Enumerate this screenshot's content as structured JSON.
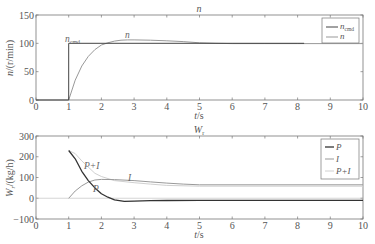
{
  "chart_data": [
    {
      "type": "line",
      "title": "n",
      "xlabel": "t/s",
      "ylabel": "n/(r/min)",
      "xlim": [
        0,
        10
      ],
      "ylim": [
        0,
        150
      ],
      "xticks": [
        "0",
        "1",
        "2",
        "3",
        "4",
        "5",
        "6",
        "7",
        "8",
        "9",
        "10"
      ],
      "yticks": [
        "0",
        "50",
        "100",
        "150"
      ],
      "grid": false,
      "legend_position": "upper right",
      "legend": [
        "n_cmd",
        "n"
      ],
      "annotations": [
        {
          "text": "n_cmd",
          "x": 0.9,
          "y": 103
        },
        {
          "text": "n",
          "x": 2.8,
          "y": 110
        }
      ],
      "series": [
        {
          "name": "n_cmd",
          "color": "#444444",
          "x": [
            0,
            1,
            1,
            8.2
          ],
          "y": [
            0,
            0,
            100,
            100
          ]
        },
        {
          "name": "n",
          "color": "#999999",
          "x": [
            1,
            1.2,
            1.4,
            1.6,
            1.8,
            2.0,
            2.2,
            2.4,
            2.6,
            2.8,
            3.0,
            3.5,
            4.0,
            4.5,
            5.0,
            5.5,
            6,
            7,
            8,
            10
          ],
          "y": [
            0,
            35,
            60,
            77,
            89,
            97,
            101,
            104,
            105.5,
            106,
            106,
            105.5,
            104.5,
            103,
            101,
            100,
            99.5,
            99.5,
            99.5,
            99.5
          ]
        }
      ]
    },
    {
      "type": "line",
      "title": "W_r",
      "xlabel": "t/s",
      "ylabel": "W_r/(kg/h)",
      "xlim": [
        0,
        10
      ],
      "ylim": [
        -100,
        300
      ],
      "xticks": [
        "0",
        "1",
        "2",
        "3",
        "4",
        "5",
        "6",
        "7",
        "8",
        "9",
        "10"
      ],
      "yticks": [
        "-100",
        "0",
        "100",
        "200",
        "300"
      ],
      "grid": false,
      "legend_position": "upper right",
      "legend": [
        "P",
        "I",
        "P+I"
      ],
      "annotations": [
        {
          "text": "P+I",
          "x": 1.5,
          "y": 150
        },
        {
          "text": "I",
          "x": 2.9,
          "y": 95
        },
        {
          "text": "P",
          "x": 1.8,
          "y": 45
        }
      ],
      "series": [
        {
          "name": "P",
          "color": "#333333",
          "x": [
            1,
            1.2,
            1.4,
            1.6,
            1.8,
            2.0,
            2.2,
            2.4,
            2.7,
            3.0,
            3.5,
            4.0,
            5.0,
            10
          ],
          "y": [
            230,
            190,
            130,
            85,
            50,
            22,
            5,
            -8,
            -15,
            -14,
            -12,
            -11,
            -10,
            -10
          ]
        },
        {
          "name": "I",
          "color": "#999999",
          "x": [
            1,
            1.2,
            1.4,
            1.6,
            1.8,
            2.0,
            2.4,
            3.0,
            3.5,
            4.0,
            4.5,
            5.0,
            10
          ],
          "y": [
            0,
            35,
            60,
            78,
            88,
            91,
            90,
            85,
            79,
            73,
            68,
            65,
            65
          ]
        },
        {
          "name": "P+I",
          "color": "#d0d0d0",
          "x": [
            1,
            1.2,
            1.4,
            1.6,
            1.8,
            2.0,
            2.4,
            3.0,
            3.5,
            4.0,
            5.0,
            10
          ],
          "y": [
            230,
            215,
            180,
            150,
            120,
            105,
            85,
            75,
            68,
            62,
            58,
            58
          ]
        }
      ]
    }
  ],
  "plots": {
    "top": {
      "title": "n",
      "xlabel": "t/s",
      "ylabel": "n/(r/min)",
      "legend": [
        {
          "label": "n",
          "sub": "cmd"
        },
        {
          "label": "n",
          "sub": ""
        }
      ],
      "ann_ncmd": "n",
      "ann_ncmd_sub": "cmd",
      "ann_n": "n"
    },
    "bottom": {
      "title": "W",
      "title_sub": "r",
      "xlabel": "t/s",
      "ylabel": "W",
      "ylabel_sub": "r",
      "ylabel_rest": "/(kg/h)",
      "legend": [
        {
          "label": "P"
        },
        {
          "label": "I"
        },
        {
          "label": "P+I"
        }
      ],
      "ann_pi": "P+I",
      "ann_i": "I",
      "ann_p": "P"
    }
  }
}
